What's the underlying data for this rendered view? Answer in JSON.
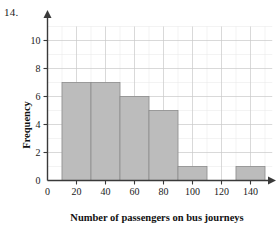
{
  "question": {
    "number": "14."
  },
  "chart_data": {
    "type": "bar",
    "title": "",
    "subtitle": "",
    "xlabel": "Number of passengers on bus journeys",
    "ylabel": "Frequency",
    "categories": [
      "10-30",
      "30-50",
      "50-70",
      "70-90",
      "90-110",
      "110-130",
      "130-150"
    ],
    "bin_edges": [
      10,
      30,
      50,
      70,
      90,
      110,
      130,
      150
    ],
    "values": [
      7,
      7,
      6,
      5,
      1,
      0,
      1
    ],
    "bars": [
      {
        "start": 10,
        "end": 30,
        "frequency": 7
      },
      {
        "start": 30,
        "end": 50,
        "frequency": 7
      },
      {
        "start": 50,
        "end": 70,
        "frequency": 6
      },
      {
        "start": 70,
        "end": 90,
        "frequency": 5
      },
      {
        "start": 90,
        "end": 110,
        "frequency": 1
      },
      {
        "start": 110,
        "end": 130,
        "frequency": 0
      },
      {
        "start": 130,
        "end": 150,
        "frequency": 1
      }
    ],
    "xlim": [
      0,
      155
    ],
    "ylim": [
      0,
      11
    ],
    "xticks": [
      0,
      20,
      40,
      60,
      80,
      100,
      120,
      140
    ],
    "xtick_labels": [
      "0",
      "20",
      "40",
      "60",
      "80",
      "100",
      "120",
      "140"
    ],
    "yticks": [
      0,
      2,
      4,
      6,
      8,
      10
    ],
    "ytick_labels": [
      "0",
      "2",
      "4",
      "6",
      "8",
      "10"
    ],
    "grid": true,
    "grid_major_x_step": 20,
    "grid_minor_x_step": 10,
    "grid_major_y_step": 2,
    "grid_minor_y_step": 1,
    "legend": null,
    "legend_position": "none",
    "annotations": [],
    "colors": {
      "bar_fill": "#bcbcbc",
      "bar_edge": "#8c8c8c",
      "axis": "#3a3a3a",
      "grid_major": "#c9c9c9",
      "grid_minor": "#e6e6e6",
      "text": "#1a1a1a",
      "background": "#ffffff"
    }
  }
}
